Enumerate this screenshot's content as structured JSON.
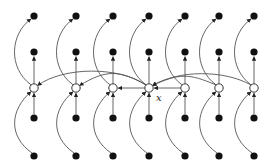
{
  "diagram": {
    "type": "graphical-model",
    "center_label": "x",
    "colors": {
      "edge": "#555555",
      "filled_node": "#111111",
      "open_node_fill": "#ffffff",
      "open_node_stroke": "#333333"
    },
    "columns_x": [
      34,
      76,
      113,
      149,
      185,
      219,
      254
    ],
    "rows_y": {
      "top": 16,
      "upper": 52,
      "middle": 88,
      "lower": 118,
      "bottom": 156
    },
    "center_index": 3,
    "arcs_from_center_to_left": [
      0,
      1,
      2
    ],
    "arcs_from_right_to_center": [
      4,
      5,
      6
    ]
  }
}
